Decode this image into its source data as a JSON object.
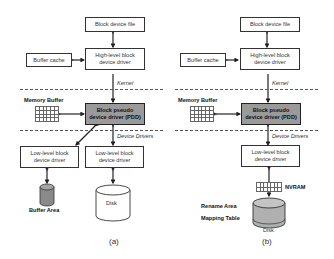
{
  "panels": {
    "a": {
      "caption": "(a)",
      "block_device_file": "Block device file",
      "buffer_cache": "Buffer cache",
      "high_level_driver": "High-level block\ndevice driver",
      "kernel_label": "Kernel",
      "memory_buffer_label": "Memory Buffer",
      "pdd": "Block pseudo\ndevice driver (PDD)",
      "device_drivers_label": "Device Drivers",
      "low_level_driver_1": "Low-level block\ndevice driver",
      "low_level_driver_2": "Low-level block\ndevice driver",
      "buffer_area_label": "Buffer Area",
      "disk_label": "Disk"
    },
    "b": {
      "caption": "(b)",
      "block_device_file": "Block device file",
      "buffer_cache": "Buffer cache",
      "high_level_driver": "High-level block\ndevice driver",
      "kernel_label": "Kernel",
      "memory_buffer_label": "Memory Buffer",
      "pdd": "Block pseudo\ndevice driver (PDD)",
      "device_drivers_label": "Device Drivers",
      "low_level_driver": "Low-level block\ndevice driver",
      "nvram_label": "NVRAM",
      "rename_area_label": "Rename Area",
      "mapping_table_label": "Mapping Table",
      "disk_label": "Disk"
    }
  },
  "colors": {
    "pdd_fill": "#9a9a9a",
    "buffer_area_fill": "#8a8a8a",
    "disk_b_fill": "#b0b0b0",
    "line": "#222222"
  }
}
